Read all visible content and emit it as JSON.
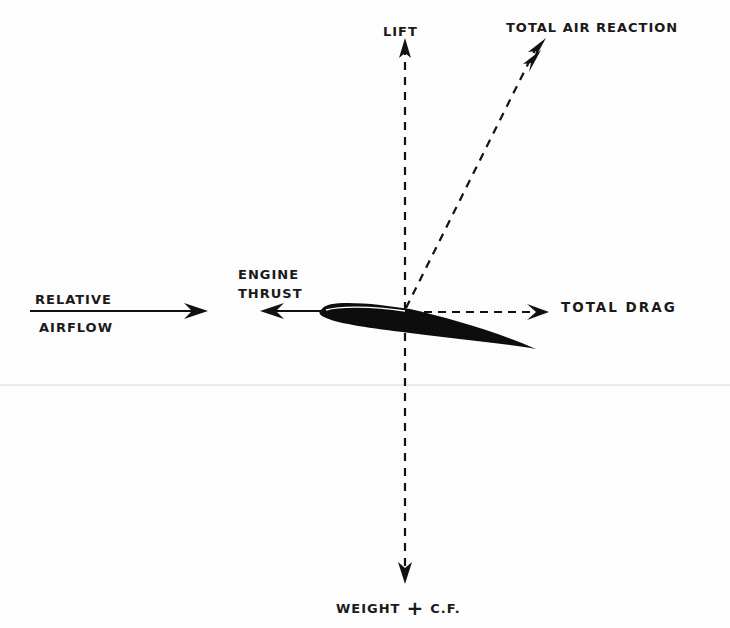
{
  "diagram": {
    "labels": {
      "lift": "LIFT",
      "total_air_reaction": "TOTAL AIR REACTION",
      "engine_thrust_line1": "ENGINE",
      "engine_thrust_line2": "THRUST",
      "relative_airflow_line1": "RELATIVE",
      "relative_airflow_line2": "AIRFLOW",
      "total_drag": "TOTAL DRAG",
      "weight": "WEIGHT",
      "plus": "+",
      "cf": "C.F."
    },
    "vectors": [
      {
        "name": "lift",
        "style": "dashed",
        "direction": "up"
      },
      {
        "name": "total_air_reaction",
        "style": "dashed",
        "direction": "up-right"
      },
      {
        "name": "total_drag",
        "style": "dashed",
        "direction": "right"
      },
      {
        "name": "weight_plus_cf",
        "style": "dashed",
        "direction": "down"
      },
      {
        "name": "engine_thrust",
        "style": "solid",
        "direction": "left"
      },
      {
        "name": "relative_airflow",
        "style": "solid",
        "direction": "right"
      }
    ],
    "colors": {
      "ink": "#111111",
      "background": "#fdfdfd",
      "fold_line": "#d8d8d8"
    }
  }
}
